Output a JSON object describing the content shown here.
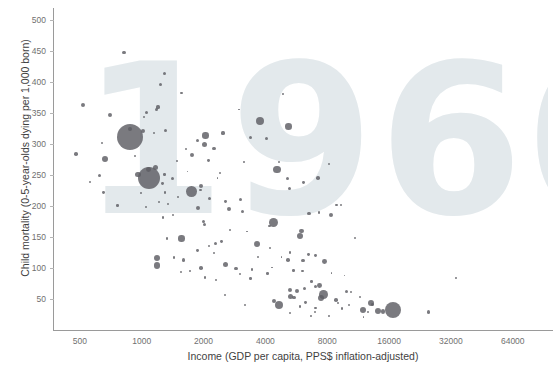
{
  "chart_data": {
    "type": "scatter",
    "title": "",
    "watermark": "1960",
    "xlabel": "Income (GDP per capita, PPS$ inflation-adjusted)",
    "ylabel": "Child mortality (0-5-year-olds dying per 1,000 born)",
    "x_scale": "log",
    "y_scale": "linear",
    "xlim": [
      370,
      95000
    ],
    "ylim": [
      0,
      520
    ],
    "x_ticks": [
      "500",
      "1000",
      "2000",
      "4000",
      "8000",
      "16000",
      "32000",
      "64000"
    ],
    "x_tick_values": [
      500,
      1000,
      2000,
      4000,
      8000,
      16000,
      32000,
      64000
    ],
    "y_ticks": [
      "500",
      "450",
      "400",
      "350",
      "300",
      "250",
      "200",
      "150",
      "100",
      "50"
    ],
    "y_tick_values": [
      500,
      450,
      400,
      350,
      300,
      250,
      200,
      150,
      100,
      50
    ],
    "grid": false,
    "legend": "none",
    "bubble_encoding": "population",
    "marker_color": "#5d5d63",
    "watermark_color": "#e3e9ec",
    "axis_color": "#9a9a9a",
    "background_color": "#ffffff",
    "points": [
      {
        "x": 820,
        "y": 448,
        "r": 1.6
      },
      {
        "x": 1290,
        "y": 414,
        "r": 1.8
      },
      {
        "x": 1230,
        "y": 396,
        "r": 1.6
      },
      {
        "x": 1560,
        "y": 383,
        "r": 1.2
      },
      {
        "x": 520,
        "y": 363,
        "r": 2.0
      },
      {
        "x": 1200,
        "y": 360,
        "r": 1.6
      },
      {
        "x": 1180,
        "y": 356,
        "r": 1.8
      },
      {
        "x": 1060,
        "y": 352,
        "r": 1.5
      },
      {
        "x": 700,
        "y": 347,
        "r": 2.0
      },
      {
        "x": 1025,
        "y": 344,
        "r": 1.2
      },
      {
        "x": 3760,
        "y": 337,
        "r": 4.0
      },
      {
        "x": 5180,
        "y": 329,
        "r": 3.3
      },
      {
        "x": 1300,
        "y": 322,
        "r": 1.5
      },
      {
        "x": 1150,
        "y": 318,
        "r": 1.2
      },
      {
        "x": 2490,
        "y": 318,
        "r": 1.6
      },
      {
        "x": 3400,
        "y": 311,
        "r": 1.6
      },
      {
        "x": 880,
        "y": 311,
        "r": 13.0
      },
      {
        "x": 1010,
        "y": 322,
        "r": 2.0
      },
      {
        "x": 2040,
        "y": 314,
        "r": 3.2
      },
      {
        "x": 1870,
        "y": 306,
        "r": 1.6
      },
      {
        "x": 2020,
        "y": 299,
        "r": 2.6
      },
      {
        "x": 2250,
        "y": 293,
        "r": 1.6
      },
      {
        "x": 480,
        "y": 284,
        "r": 1.8
      },
      {
        "x": 1760,
        "y": 283,
        "r": 2.0
      },
      {
        "x": 660,
        "y": 276,
        "r": 3.0
      },
      {
        "x": 2120,
        "y": 274,
        "r": 1.4
      },
      {
        "x": 4640,
        "y": 272,
        "r": 1.0
      },
      {
        "x": 8150,
        "y": 268,
        "r": 1.2
      },
      {
        "x": 4560,
        "y": 259,
        "r": 3.6
      },
      {
        "x": 1170,
        "y": 262,
        "r": 2.6
      },
      {
        "x": 1080,
        "y": 259,
        "r": 2.4
      },
      {
        "x": 960,
        "y": 251,
        "r": 2.8
      },
      {
        "x": 1090,
        "y": 246,
        "r": 11.0
      },
      {
        "x": 620,
        "y": 249,
        "r": 1.5
      },
      {
        "x": 1290,
        "y": 251,
        "r": 1.2
      },
      {
        "x": 5140,
        "y": 245,
        "r": 1.6
      },
      {
        "x": 1410,
        "y": 244,
        "r": 1.5
      },
      {
        "x": 6150,
        "y": 238,
        "r": 1.4
      },
      {
        "x": 1260,
        "y": 236,
        "r": 1.4
      },
      {
        "x": 1950,
        "y": 232,
        "r": 2.0
      },
      {
        "x": 1740,
        "y": 224,
        "r": 5.4
      },
      {
        "x": 1930,
        "y": 226,
        "r": 1.2
      },
      {
        "x": 5220,
        "y": 229,
        "r": 1.6
      },
      {
        "x": 650,
        "y": 222,
        "r": 1.4
      },
      {
        "x": 1300,
        "y": 222,
        "r": 1.2
      },
      {
        "x": 7220,
        "y": 245,
        "r": 1.8
      },
      {
        "x": 1500,
        "y": 215,
        "r": 1.2
      },
      {
        "x": 2130,
        "y": 213,
        "r": 1.6
      },
      {
        "x": 3010,
        "y": 211,
        "r": 1.5
      },
      {
        "x": 2560,
        "y": 208,
        "r": 1.4
      },
      {
        "x": 1220,
        "y": 206,
        "r": 1.0
      },
      {
        "x": 1340,
        "y": 204,
        "r": 1.0
      },
      {
        "x": 760,
        "y": 201,
        "r": 1.3
      },
      {
        "x": 8870,
        "y": 202,
        "r": 1.1
      },
      {
        "x": 1880,
        "y": 197,
        "r": 2.0
      },
      {
        "x": 2660,
        "y": 196,
        "r": 2.0
      },
      {
        "x": 3090,
        "y": 192,
        "r": 1.5
      },
      {
        "x": 7300,
        "y": 190,
        "r": 1.3
      },
      {
        "x": 6540,
        "y": 188,
        "r": 1.8
      },
      {
        "x": 8300,
        "y": 185,
        "r": 2.0
      },
      {
        "x": 4390,
        "y": 173,
        "r": 4.6
      },
      {
        "x": 2000,
        "y": 175,
        "r": 1.6
      },
      {
        "x": 2020,
        "y": 170,
        "r": 1.6
      },
      {
        "x": 4190,
        "y": 168,
        "r": 1.2
      },
      {
        "x": 5970,
        "y": 160,
        "r": 2.4
      },
      {
        "x": 5880,
        "y": 152,
        "r": 3.0
      },
      {
        "x": 1560,
        "y": 148,
        "r": 3.2
      },
      {
        "x": 1330,
        "y": 148,
        "r": 1.3
      },
      {
        "x": 3660,
        "y": 139,
        "r": 3.0
      },
      {
        "x": 2440,
        "y": 143,
        "r": 1.4
      },
      {
        "x": 2280,
        "y": 140,
        "r": 1.6
      },
      {
        "x": 2130,
        "y": 135,
        "r": 1.1
      },
      {
        "x": 4200,
        "y": 132,
        "r": 1.0
      },
      {
        "x": 1870,
        "y": 128,
        "r": 1.4
      },
      {
        "x": 5270,
        "y": 125,
        "r": 1.3
      },
      {
        "x": 6460,
        "y": 122,
        "r": 1.4
      },
      {
        "x": 7040,
        "y": 120,
        "r": 1.4
      },
      {
        "x": 1190,
        "y": 117,
        "r": 3.0
      },
      {
        "x": 1440,
        "y": 117,
        "r": 1.2
      },
      {
        "x": 1600,
        "y": 113,
        "r": 1.6
      },
      {
        "x": 1190,
        "y": 104,
        "r": 3.2
      },
      {
        "x": 2550,
        "y": 106,
        "r": 2.6
      },
      {
        "x": 5150,
        "y": 113,
        "r": 1.8
      },
      {
        "x": 6100,
        "y": 112,
        "r": 1.6
      },
      {
        "x": 7730,
        "y": 110,
        "r": 2.4
      },
      {
        "x": 1950,
        "y": 100,
        "r": 1.8
      },
      {
        "x": 2880,
        "y": 99,
        "r": 1.6
      },
      {
        "x": 3450,
        "y": 98,
        "r": 1.2
      },
      {
        "x": 5480,
        "y": 96,
        "r": 1.2
      },
      {
        "x": 6060,
        "y": 95,
        "r": 1.2
      },
      {
        "x": 1550,
        "y": 93,
        "r": 1.0
      },
      {
        "x": 3000,
        "y": 91,
        "r": 1.0
      },
      {
        "x": 4090,
        "y": 91,
        "r": 1.3
      },
      {
        "x": 2030,
        "y": 85,
        "r": 1.2
      },
      {
        "x": 3390,
        "y": 83,
        "r": 1.2
      },
      {
        "x": 2290,
        "y": 80,
        "r": 1.0
      },
      {
        "x": 6710,
        "y": 78,
        "r": 1.3
      },
      {
        "x": 7340,
        "y": 72,
        "r": 2.4
      },
      {
        "x": 7040,
        "y": 70,
        "r": 1.6
      },
      {
        "x": 6210,
        "y": 67,
        "r": 1.8
      },
      {
        "x": 5290,
        "y": 65,
        "r": 2.0
      },
      {
        "x": 5700,
        "y": 63,
        "r": 2.4
      },
      {
        "x": 9960,
        "y": 62,
        "r": 1.6
      },
      {
        "x": 7640,
        "y": 57,
        "r": 4.4
      },
      {
        "x": 5300,
        "y": 54,
        "r": 2.6
      },
      {
        "x": 5510,
        "y": 52,
        "r": 1.6
      },
      {
        "x": 7460,
        "y": 52,
        "r": 3.2
      },
      {
        "x": 8820,
        "y": 48,
        "r": 1.8
      },
      {
        "x": 4420,
        "y": 47,
        "r": 2.2
      },
      {
        "x": 6290,
        "y": 45,
        "r": 1.4
      },
      {
        "x": 13100,
        "y": 44,
        "r": 3.2
      },
      {
        "x": 13300,
        "y": 41,
        "r": 1.6
      },
      {
        "x": 4660,
        "y": 40,
        "r": 4.2
      },
      {
        "x": 5880,
        "y": 38,
        "r": 1.2
      },
      {
        "x": 7020,
        "y": 36,
        "r": 1.2
      },
      {
        "x": 16700,
        "y": 33,
        "r": 8.0
      },
      {
        "x": 11900,
        "y": 32,
        "r": 3.0
      },
      {
        "x": 14200,
        "y": 31,
        "r": 3.0
      },
      {
        "x": 14900,
        "y": 30,
        "r": 2.2
      },
      {
        "x": 12600,
        "y": 29,
        "r": 1.2
      },
      {
        "x": 6940,
        "y": 29,
        "r": 1.0
      },
      {
        "x": 5250,
        "y": 27,
        "r": 1.0
      },
      {
        "x": 25000,
        "y": 29,
        "r": 1.6
      },
      {
        "x": 9450,
        "y": 35,
        "r": 1.2
      },
      {
        "x": 3200,
        "y": 41,
        "r": 1.0
      },
      {
        "x": 2540,
        "y": 56,
        "r": 1.0
      },
      {
        "x": 1270,
        "y": 182,
        "r": 1.3
      },
      {
        "x": 1420,
        "y": 186,
        "r": 1.0
      },
      {
        "x": 560,
        "y": 239,
        "r": 1.0
      },
      {
        "x": 640,
        "y": 302,
        "r": 1.0
      },
      {
        "x": 880,
        "y": 324,
        "r": 2.0
      },
      {
        "x": 930,
        "y": 281,
        "r": 1.0
      },
      {
        "x": 2410,
        "y": 254,
        "r": 1.0
      },
      {
        "x": 4060,
        "y": 310,
        "r": 1.5
      },
      {
        "x": 9300,
        "y": 202,
        "r": 1.0
      },
      {
        "x": 10900,
        "y": 148,
        "r": 1.0
      },
      {
        "x": 34000,
        "y": 84,
        "r": 0.9
      },
      {
        "x": 2980,
        "y": 356,
        "r": 0.9
      },
      {
        "x": 4880,
        "y": 381,
        "r": 0.9
      },
      {
        "x": 1640,
        "y": 292,
        "r": 1.0
      },
      {
        "x": 1490,
        "y": 273,
        "r": 0.9
      },
      {
        "x": 3140,
        "y": 271,
        "r": 0.9
      },
      {
        "x": 1670,
        "y": 256,
        "r": 0.9
      },
      {
        "x": 2340,
        "y": 245,
        "r": 0.9
      },
      {
        "x": 1050,
        "y": 198,
        "r": 1.0
      },
      {
        "x": 990,
        "y": 221,
        "r": 0.9
      },
      {
        "x": 2700,
        "y": 162,
        "r": 1.0
      },
      {
        "x": 3250,
        "y": 159,
        "r": 0.9
      },
      {
        "x": 2250,
        "y": 124,
        "r": 1.0
      },
      {
        "x": 3700,
        "y": 118,
        "r": 1.0
      },
      {
        "x": 4320,
        "y": 101,
        "r": 0.9
      },
      {
        "x": 4790,
        "y": 118,
        "r": 0.9
      },
      {
        "x": 1720,
        "y": 95,
        "r": 0.9
      },
      {
        "x": 8400,
        "y": 92,
        "r": 0.9
      },
      {
        "x": 9700,
        "y": 88,
        "r": 0.9
      },
      {
        "x": 10500,
        "y": 61,
        "r": 1.0
      },
      {
        "x": 11500,
        "y": 53,
        "r": 1.0
      },
      {
        "x": 8980,
        "y": 44,
        "r": 1.0
      },
      {
        "x": 10200,
        "y": 40,
        "r": 1.0
      },
      {
        "x": 6650,
        "y": 22,
        "r": 0.9
      },
      {
        "x": 8130,
        "y": 22,
        "r": 0.9
      },
      {
        "x": 12000,
        "y": 21,
        "r": 0.9
      }
    ]
  }
}
